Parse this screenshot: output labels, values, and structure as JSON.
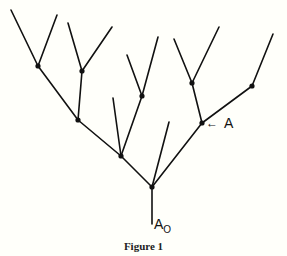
{
  "diagram": {
    "type": "branching-tree",
    "caption": "Figure 1",
    "stroke_color": "#111111",
    "background": "#fffffa",
    "nodes": [
      {
        "id": "root",
        "x": 152,
        "y": 187
      },
      {
        "id": "n1",
        "x": 121,
        "y": 156
      },
      {
        "id": "n2",
        "x": 78,
        "y": 120
      },
      {
        "id": "n3",
        "x": 38,
        "y": 66
      },
      {
        "id": "n4",
        "x": 82,
        "y": 71
      },
      {
        "id": "n5",
        "x": 142,
        "y": 96
      },
      {
        "id": "A",
        "x": 202,
        "y": 123
      },
      {
        "id": "n6",
        "x": 192,
        "y": 83
      },
      {
        "id": "n7",
        "x": 252,
        "y": 86
      }
    ],
    "edges": [
      [
        152,
        224,
        152,
        187
      ],
      [
        152,
        187,
        121,
        156
      ],
      [
        152,
        187,
        169,
        122
      ],
      [
        152,
        187,
        202,
        123
      ],
      [
        121,
        156,
        78,
        120
      ],
      [
        121,
        156,
        113,
        98
      ],
      [
        121,
        156,
        142,
        96
      ],
      [
        78,
        120,
        38,
        66
      ],
      [
        78,
        120,
        82,
        71
      ],
      [
        38,
        66,
        11,
        10
      ],
      [
        38,
        66,
        57,
        15
      ],
      [
        82,
        71,
        68,
        23
      ],
      [
        82,
        71,
        112,
        27
      ],
      [
        142,
        96,
        127,
        55
      ],
      [
        142,
        96,
        158,
        37
      ],
      [
        202,
        123,
        192,
        83
      ],
      [
        202,
        123,
        252,
        86
      ],
      [
        192,
        83,
        174,
        39
      ],
      [
        192,
        83,
        219,
        27
      ],
      [
        252,
        86,
        273,
        34
      ]
    ],
    "labels": {
      "a_arrow": "←",
      "a_label": "A",
      "a0_main": "A",
      "a0_sub": "O"
    }
  }
}
